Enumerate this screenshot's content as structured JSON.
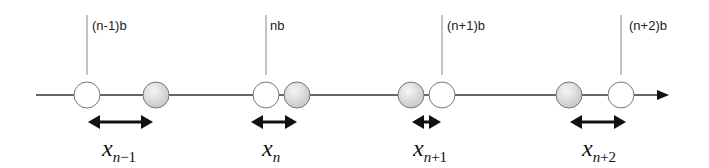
{
  "diagram": {
    "type": "1D lattice displacement diagram",
    "axis": {
      "y": 95,
      "x_start": 36,
      "x_end": 668,
      "has_arrowhead": true
    },
    "lattice_sites": [
      {
        "label": "(n-1)b",
        "x": 87
      },
      {
        "label": "nb",
        "x": 266
      },
      {
        "label": "(n+1)b",
        "x": 442
      },
      {
        "label": "(n+2)b",
        "x": 621
      }
    ],
    "atoms": [
      {
        "role": "reference",
        "fill": "white",
        "x": 87
      },
      {
        "role": "displaced",
        "fill": "grey",
        "x": 156
      },
      {
        "role": "reference",
        "fill": "white",
        "x": 266
      },
      {
        "role": "displaced",
        "fill": "grey",
        "x": 297
      },
      {
        "role": "displaced",
        "fill": "grey",
        "x": 411
      },
      {
        "role": "reference",
        "fill": "white",
        "x": 442
      },
      {
        "role": "displaced",
        "fill": "grey",
        "x": 569
      },
      {
        "role": "reference",
        "fill": "white",
        "x": 621
      }
    ],
    "displacements": [
      {
        "symbol": "x",
        "subscript": "n",
        "subscript_suffix": "−1",
        "arrow_x1": 88,
        "arrow_x2": 153,
        "label_x": 117
      },
      {
        "symbol": "x",
        "subscript": "n",
        "subscript_suffix": "",
        "arrow_x1": 251,
        "arrow_x2": 297,
        "label_x": 272
      },
      {
        "symbol": "x",
        "subscript": "n",
        "subscript_suffix": "+1",
        "arrow_x1": 412,
        "arrow_x2": 441,
        "label_x": 427
      },
      {
        "symbol": "x",
        "subscript": "n",
        "subscript_suffix": "+2",
        "arrow_x1": 570,
        "arrow_x2": 626,
        "label_x": 600
      }
    ],
    "colors": {
      "axis": "#333333",
      "tick": "#888888",
      "atom_stroke": "#777777",
      "atom_white": "#ffffff",
      "atom_grey": "#d4d4d4",
      "arrow": "#111111"
    }
  }
}
